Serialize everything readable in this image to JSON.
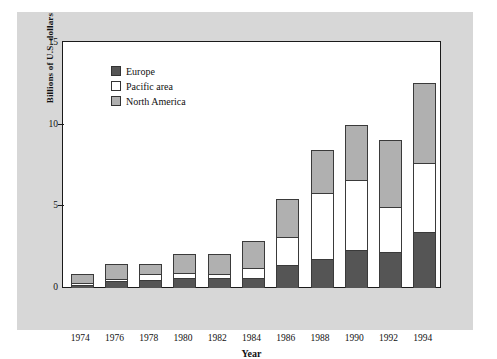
{
  "chart_data": {
    "type": "bar",
    "subtype": "stacked-vertical",
    "title": "",
    "xlabel": "Year",
    "ylabel": "Billions of U.S. dollars",
    "ylim": [
      0,
      15
    ],
    "yticks": [
      0,
      5,
      10,
      15
    ],
    "grid": false,
    "legend_position": "upper-left-inside",
    "categories": [
      "1974",
      "1976",
      "1978",
      "1980",
      "1982",
      "1984",
      "1986",
      "1988",
      "1990",
      "1992",
      "1994"
    ],
    "series": [
      {
        "name": "Europe",
        "color": "#555555",
        "values": [
          0.2,
          0.4,
          0.5,
          0.6,
          0.6,
          0.6,
          1.4,
          1.8,
          2.3,
          2.2,
          3.4
        ]
      },
      {
        "name": "Pacific area",
        "color": "#ffffff",
        "values": [
          0.15,
          0.2,
          0.4,
          0.4,
          0.3,
          0.7,
          1.8,
          4.1,
          4.4,
          2.8,
          4.3
        ]
      },
      {
        "name": "North America",
        "color": "#b0b0b0",
        "values": [
          0.65,
          1.0,
          0.7,
          1.2,
          1.3,
          1.7,
          2.4,
          2.7,
          3.4,
          4.2,
          5.0
        ]
      }
    ],
    "totals": [
      1.0,
      1.6,
      1.6,
      2.2,
      2.2,
      3.0,
      5.6,
      8.6,
      10.1,
      9.2,
      12.7
    ]
  },
  "legend": {
    "items": [
      {
        "label": "Europe",
        "color": "#555555"
      },
      {
        "label": "Pacific area",
        "color": "#ffffff"
      },
      {
        "label": "North America",
        "color": "#b0b0b0"
      }
    ]
  },
  "axes": {
    "y_title": "Billions of U.S. dollars",
    "x_title": "Year",
    "y_tick_labels": [
      "0",
      "5",
      "10",
      "15"
    ],
    "x_tick_labels": [
      "1974",
      "1976",
      "1978",
      "1980",
      "1982",
      "1984",
      "1986",
      "1988",
      "1990",
      "1992",
      "1994"
    ]
  },
  "style": {
    "mat_color": "#d7d7d7",
    "plot_background": "#ffffff",
    "axis_color": "#1a1a1a"
  }
}
